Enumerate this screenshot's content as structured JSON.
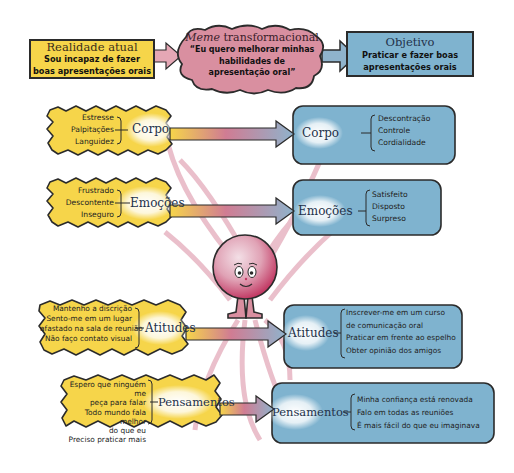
{
  "colors": {
    "yellow_box": "#f6d54a",
    "blue_box": "#7fb3cf",
    "pink_cloud": "#d98fa0",
    "arrow_pink": "#c9708a",
    "arrow_blue": "#8fb3cc",
    "outline": "#2b2b2b"
  },
  "top": {
    "current": {
      "title": "Realidade atual",
      "text_line1": "Sou incapaz de fazer",
      "text_line2": "boas apresentações orais"
    },
    "meme": {
      "title_italic": "Meme",
      "title_rest": " transformacional",
      "text_line1": "“Eu quero melhorar minhas",
      "text_line2": "habilidades de",
      "text_line3": "apresentação oral”"
    },
    "goal": {
      "title": "Objetivo",
      "text_line1": "Praticar e fazer boas",
      "text_line2": "apresentações orais"
    }
  },
  "left": [
    {
      "label": "Corpo",
      "items": [
        "Estresse",
        "Palpitações",
        "Languidez"
      ]
    },
    {
      "label": "Emoções",
      "items": [
        "Frustrado",
        "Descontente",
        "Inseguro"
      ]
    },
    {
      "label": "Atitudes",
      "items": [
        "Mantenho a discrição",
        "Sento-me em um lugar",
        "afastado na sala de reunião",
        "Não faço contato visual"
      ]
    },
    {
      "label": "Pensamentos",
      "items": [
        "Espero que ninguém me",
        "peça para falar",
        "Todo mundo fala melhor",
        "do que eu",
        "Preciso praticar mais"
      ]
    }
  ],
  "right": [
    {
      "label": "Corpo",
      "items": [
        "Descontração",
        "Controle",
        "Cordialidade"
      ]
    },
    {
      "label": "Emoções",
      "items": [
        "Satisfeito",
        "Disposto",
        "Surpreso"
      ]
    },
    {
      "label": "Atitudes",
      "items": [
        "Inscrever-me em um curso",
        "de comunicação oral",
        "Praticar em frente ao espelho",
        "Obter opinião dos amigos"
      ]
    },
    {
      "label": "Pensamentos",
      "items": [
        "Minha confiança está renovada",
        "Falo em todas as reuniões",
        "É mais fácil do que eu imaginava"
      ]
    }
  ]
}
